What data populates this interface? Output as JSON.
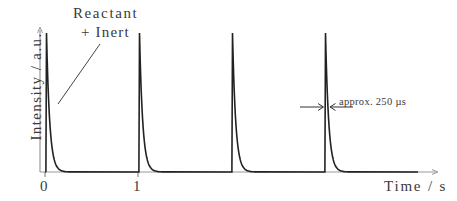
{
  "chart_data": {
    "type": "line",
    "title": "",
    "xlabel": "Time / s",
    "ylabel": "Intensity / a.u.",
    "x_ticks": [
      "0",
      "1"
    ],
    "grid": false,
    "legend": null,
    "series": [
      {
        "name": "Reactant + Inert pulses",
        "description": "Periodic sharp pulses with exponential tail decay, one per second",
        "peak_times_s": [
          0,
          1,
          2,
          3
        ],
        "peak_intensity_au": 1.0,
        "baseline_au": 0.0,
        "pulse_width": "approx. 250 µs"
      }
    ],
    "annotations": [
      {
        "text": "Reactant\n+ Inert",
        "points_to": "first pulse"
      },
      {
        "text": "approx. 250 µs",
        "marks": "width of fourth pulse (double arrows)"
      }
    ],
    "colors": {
      "trace": "#222222",
      "axis": "#999999",
      "text": "#3a3a3a"
    }
  },
  "labels": {
    "annotation_line1": "Reactant",
    "annotation_line2": "+ Inert",
    "ylabel": "Intensity / a.u.",
    "xlabel": "Time / s",
    "tick0": "0",
    "tick1": "1",
    "width_annotation": "approx. 250 µs"
  }
}
